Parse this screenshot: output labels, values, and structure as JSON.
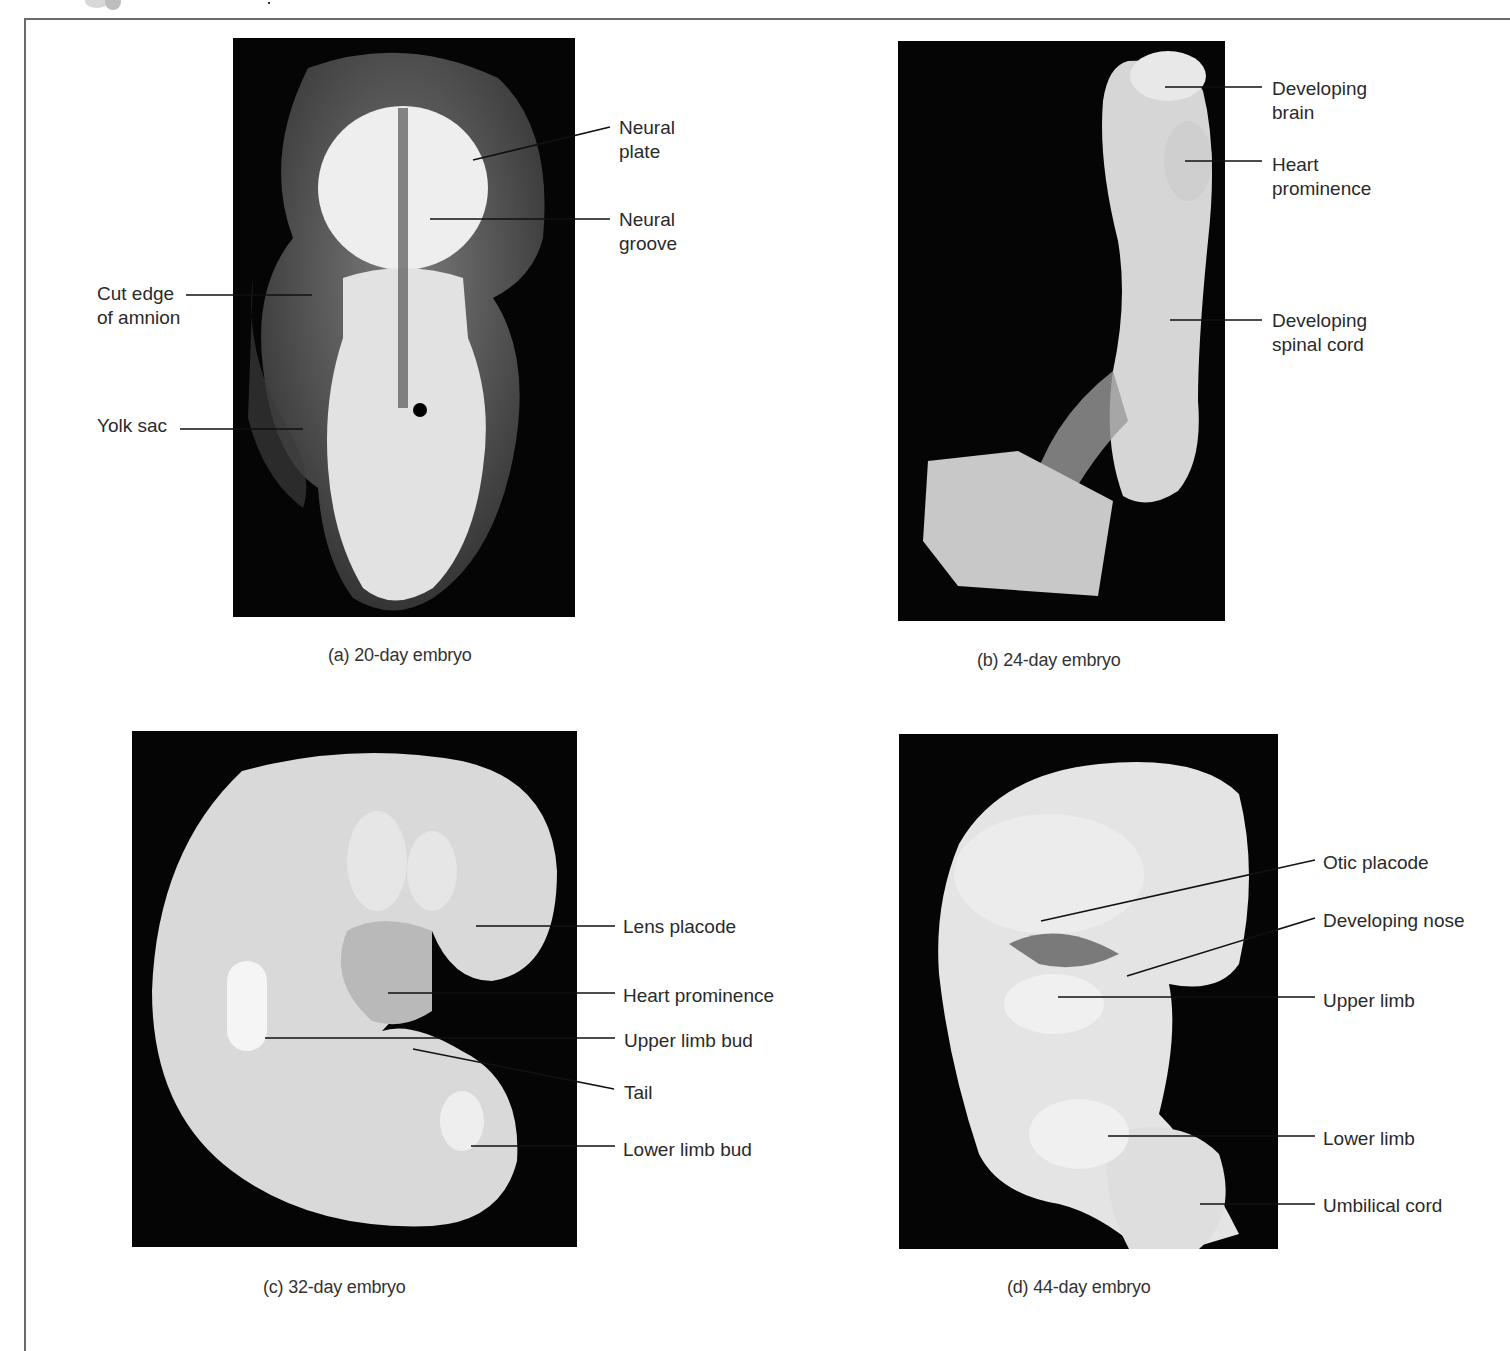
{
  "figure": {
    "panels": [
      {
        "id": "a",
        "caption": "(a) 20-day embryo",
        "labels": [
          {
            "text": "Neural\nplate"
          },
          {
            "text": "Neural\ngroove"
          },
          {
            "text": "Cut edge\nof amnion"
          },
          {
            "text": "Yolk sac"
          }
        ]
      },
      {
        "id": "b",
        "caption": "(b) 24-day embryo",
        "labels": [
          {
            "text": "Developing\nbrain"
          },
          {
            "text": "Heart\nprominence"
          },
          {
            "text": "Developing\nspinal cord"
          }
        ]
      },
      {
        "id": "c",
        "caption": "(c) 32-day embryo",
        "labels": [
          {
            "text": "Lens placode"
          },
          {
            "text": "Heart prominence"
          },
          {
            "text": "Upper limb bud"
          },
          {
            "text": "Tail"
          },
          {
            "text": "Lower limb bud"
          }
        ]
      },
      {
        "id": "d",
        "caption": "(d) 44-day embryo",
        "labels": [
          {
            "text": "Otic placode"
          },
          {
            "text": "Developing nose"
          },
          {
            "text": "Upper limb"
          },
          {
            "text": "Lower limb"
          },
          {
            "text": "Umbilical cord"
          }
        ]
      }
    ]
  },
  "colors": {
    "photo_background": "#050505",
    "tissue": "#e6e6e6",
    "frame": "#6a6a6a",
    "text": "#2a2a2a"
  }
}
